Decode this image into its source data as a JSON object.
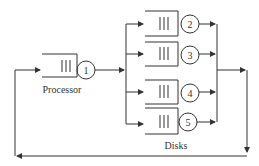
{
  "diagram": {
    "type": "queueing-network",
    "stroke_color": "#333333",
    "background": "#ffffff",
    "processor": {
      "label": "Processor",
      "server_id": "1"
    },
    "disks": {
      "label": "Disks",
      "servers": [
        {
          "id": "2"
        },
        {
          "id": "3"
        },
        {
          "id": "4"
        },
        {
          "id": "5"
        }
      ]
    },
    "edges": [
      {
        "from": "feedback",
        "to": "1"
      },
      {
        "from": "1",
        "to": "2"
      },
      {
        "from": "1",
        "to": "3"
      },
      {
        "from": "1",
        "to": "4"
      },
      {
        "from": "1",
        "to": "5"
      },
      {
        "from": "2",
        "to": "merge"
      },
      {
        "from": "3",
        "to": "merge"
      },
      {
        "from": "4",
        "to": "merge"
      },
      {
        "from": "5",
        "to": "merge"
      },
      {
        "from": "merge",
        "to": "feedback"
      }
    ]
  }
}
